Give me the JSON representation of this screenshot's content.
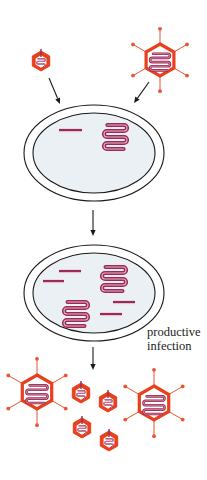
{
  "diagram": {
    "title": "",
    "label": {
      "line1": "productive",
      "line2": "infection"
    },
    "colors": {
      "capsid": "#e8401c",
      "spike": "#e8552f",
      "dna": "#9c2a55",
      "dna_highlight": "#e8b4c8",
      "cell_fill": "#eaf0f4",
      "outline": "#1a1a1a"
    },
    "top_viruses": [
      {
        "type": "small",
        "cx": 41,
        "cy": 61,
        "r": 10
      },
      {
        "type": "large",
        "cx": 160,
        "cy": 60,
        "r": 16
      }
    ],
    "cells": [
      {
        "id": "cell-1",
        "cx": 94,
        "cy": 153,
        "outer_rx": 70,
        "outer_ry": 48,
        "inner_rx": 61,
        "inner_ry": 40,
        "linear_dna": [
          {
            "x1": 59,
            "x2": 82,
            "y": 130
          }
        ],
        "coiled_dna": [
          {
            "x": 104,
            "y": 122,
            "w": 23,
            "h": 24
          }
        ]
      },
      {
        "id": "cell-2",
        "cx": 94,
        "cy": 293,
        "outer_rx": 70,
        "outer_ry": 48,
        "inner_rx": 61,
        "inner_ry": 40,
        "linear_dna": [
          {
            "x1": 59,
            "x2": 81,
            "y": 271
          },
          {
            "x1": 43,
            "x2": 64,
            "y": 281
          },
          {
            "x1": 113,
            "x2": 135,
            "y": 302
          },
          {
            "x1": 100,
            "x2": 122,
            "y": 314
          }
        ],
        "coiled_dna": [
          {
            "x": 102,
            "y": 264,
            "w": 24,
            "h": 24
          },
          {
            "x": 64,
            "y": 299,
            "w": 24,
            "h": 24
          }
        ]
      }
    ],
    "arrows": [
      {
        "x1": 49,
        "y1": 78,
        "x2": 60,
        "y2": 104
      },
      {
        "x1": 149,
        "y1": 82,
        "x2": 134,
        "y2": 103
      },
      {
        "x1": 93,
        "y1": 210,
        "x2": 93,
        "y2": 236
      },
      {
        "x1": 93,
        "y1": 347,
        "x2": 93,
        "y2": 370
      }
    ],
    "progeny_viruses": [
      {
        "type": "large",
        "cx": 37,
        "cy": 392,
        "r": 17
      },
      {
        "type": "small",
        "cx": 81,
        "cy": 393,
        "r": 10
      },
      {
        "type": "small",
        "cx": 108,
        "cy": 402,
        "r": 10
      },
      {
        "type": "small",
        "cx": 82,
        "cy": 428,
        "r": 10
      },
      {
        "type": "small",
        "cx": 109,
        "cy": 441,
        "r": 10
      },
      {
        "type": "large",
        "cx": 154,
        "cy": 403,
        "r": 17
      }
    ]
  }
}
